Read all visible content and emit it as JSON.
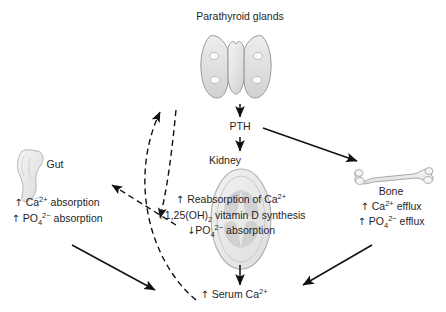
{
  "diagram": {
    "title": "Parathyroid glands",
    "background_color": "#ffffff",
    "text_color": "#1f1f1f",
    "organ_fill": "#e8e8e8",
    "organ_stroke": "#9a9a9a"
  },
  "nodes": {
    "parathyroid": {
      "label": "Parathyroid glands",
      "icon": "thyroid-parathyroid-gland-illustration"
    },
    "pth": {
      "label": "PTH"
    },
    "kidney": {
      "label": "Kidney",
      "icon": "kidney-cross-section-illustration",
      "effects": [
        {
          "arrow": "↑",
          "text_before": " Reabsorption of Ca",
          "sup": "2+",
          "text_after": ""
        },
        {
          "arrow": "↑",
          "text_before": "1,25(OH)",
          "sub": "2",
          "text_after": " vitamin D synthesis"
        },
        {
          "arrow": "↓",
          "text_before": "PO",
          "sub": "4",
          "sup": "2−",
          "text_after": " absorption"
        }
      ]
    },
    "gut": {
      "label": "Gut",
      "icon": "intestine-illustration",
      "effects": [
        {
          "arrow": "↑",
          "text_before": " Ca",
          "sup": "2+",
          "text_after": " absorption"
        },
        {
          "arrow": "↑",
          "text_before": " PO",
          "sub": "4",
          "sup": "2−",
          "text_after": " absorption"
        }
      ]
    },
    "bone": {
      "label": "Bone",
      "icon": "femur-bone-illustration",
      "effects": [
        {
          "arrow": "↑",
          "text_before": " Ca",
          "sup": "2+",
          "text_after": " efflux"
        },
        {
          "arrow": "↑",
          "text_before": " PO",
          "sub": "4",
          "sup": "2−",
          "text_after": " efflux"
        }
      ]
    },
    "serum": {
      "arrow": "↑",
      "text_before": " Serum Ca",
      "sup": "2+"
    }
  },
  "edges": [
    {
      "name": "parathyroid-to-pth",
      "style": "solid",
      "from": "parathyroid",
      "to": "pth"
    },
    {
      "name": "pth-to-kidney",
      "style": "solid",
      "from": "pth",
      "to": "kidney"
    },
    {
      "name": "pth-to-bone",
      "style": "solid",
      "from": "pth",
      "to": "bone"
    },
    {
      "name": "kidney-to-serum",
      "style": "solid",
      "from": "kidney",
      "to": "serum"
    },
    {
      "name": "gut-to-serum",
      "style": "solid",
      "from": "gut",
      "to": "serum"
    },
    {
      "name": "bone-to-serum",
      "style": "solid",
      "from": "bone",
      "to": "serum"
    },
    {
      "name": "kidney-to-gut-vitamin-d",
      "style": "dashed",
      "from": "kidney",
      "to": "gut"
    },
    {
      "name": "serum-negative-feedback-to-parathyroid",
      "style": "dashed",
      "from": "serum",
      "to": "parathyroid"
    },
    {
      "name": "kidney-feedback-to-parathyroid",
      "style": "dashed",
      "from": "kidney",
      "to": "parathyroid"
    }
  ]
}
